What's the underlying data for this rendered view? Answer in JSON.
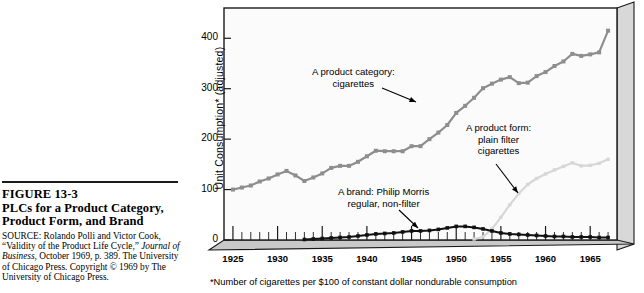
{
  "figure": {
    "number": "FIGURE 13-3",
    "title_line1": "PLCs for a Product Category,",
    "title_line2": "Product Form, and Brand",
    "source_prefix": "SOURCE: Rolando Polli and Victor Cook, “Validity of the Product Life Cycle,” ",
    "source_italic1": "Journal",
    "source_mid": " ",
    "source_italic2": "of Business",
    "source_suffix": ", October 1969, p. 389. The University of Chicago Press. Copyright © 1969 by The University of Chicago Press."
  },
  "chart_data": {
    "type": "line",
    "title": "PLCs for a Product Category, Product Form, and Brand",
    "xlabel": "",
    "ylabel": "Unit Consumption* (adjusted)",
    "footnote": "*Number of cigarettes per $100 of constant dollar nondurable consumption",
    "xlim": [
      1924,
      1968
    ],
    "ylim": [
      0,
      460
    ],
    "xticks": [
      1925,
      1930,
      1935,
      1940,
      1945,
      1950,
      1955,
      1960,
      1965
    ],
    "yticks": [
      0,
      100,
      200,
      300,
      400
    ],
    "grid": false,
    "legend_position": "annotations",
    "colors": {
      "category": "#8e8e8e",
      "form": "#d7d7d7",
      "brand": "#111111",
      "plot_background": "#fbfbfb",
      "floor": "#c9c9c9",
      "side_panel": "#d8d8d8",
      "frame": "#1a1a1a"
    },
    "series": [
      {
        "name": "A product category: cigarettes",
        "color": "#8e8e8e",
        "x": [
          1925,
          1926,
          1927,
          1928,
          1929,
          1930,
          1931,
          1932,
          1933,
          1934,
          1935,
          1936,
          1937,
          1938,
          1939,
          1940,
          1941,
          1942,
          1943,
          1944,
          1945,
          1946,
          1947,
          1948,
          1949,
          1950,
          1951,
          1952,
          1953,
          1954,
          1955,
          1956,
          1957,
          1958,
          1959,
          1960,
          1961,
          1962,
          1963,
          1964,
          1965,
          1966,
          1967
        ],
        "values": [
          100,
          104,
          108,
          116,
          122,
          130,
          137,
          128,
          117,
          124,
          132,
          143,
          147,
          147,
          155,
          166,
          177,
          176,
          176,
          176,
          186,
          186,
          200,
          213,
          228,
          252,
          266,
          282,
          301,
          310,
          318,
          323,
          311,
          312,
          325,
          333,
          345,
          354,
          369,
          365,
          368,
          372,
          415
        ]
      },
      {
        "name": "A product form: plain filter cigarettes",
        "color": "#d7d7d7",
        "x": [
          1952,
          1953,
          1954,
          1955,
          1956,
          1957,
          1958,
          1959,
          1960,
          1961,
          1962,
          1963,
          1964,
          1965,
          1966,
          1967
        ],
        "values": [
          2,
          6,
          22,
          45,
          70,
          92,
          110,
          122,
          131,
          139,
          146,
          153,
          147,
          148,
          152,
          160
        ]
      },
      {
        "name": "A brand: Philip Morris regular, non-filter",
        "color": "#111111",
        "x": [
          1933,
          1934,
          1935,
          1936,
          1937,
          1938,
          1939,
          1940,
          1941,
          1942,
          1943,
          1944,
          1945,
          1946,
          1947,
          1948,
          1949,
          1950,
          1951,
          1952,
          1953,
          1954,
          1955,
          1956,
          1957,
          1958,
          1959,
          1960,
          1961,
          1962,
          1963,
          1964,
          1965,
          1966,
          1967
        ],
        "values": [
          1,
          2,
          3,
          4,
          5,
          6,
          8,
          10,
          12,
          13,
          14,
          16,
          18,
          18,
          19,
          21,
          24,
          27,
          27,
          25,
          22,
          18,
          14,
          12,
          11,
          10,
          9,
          8,
          7,
          7,
          6,
          6,
          6,
          5,
          5
        ]
      }
    ],
    "annotations": [
      {
        "id": "category",
        "line1": "A product category:",
        "line2": "cigarettes",
        "label_x": 116,
        "label_y": 66,
        "arrow_from_x": 186,
        "arrow_from_y": 88,
        "arrow_to_x": 220,
        "arrow_to_y": 102
      },
      {
        "id": "form",
        "line1": "A product form:",
        "line2": "plain filter",
        "line3": "cigarettes",
        "label_x": 270,
        "label_y": 122,
        "arrow_from_x": 300,
        "arrow_from_y": 164,
        "arrow_to_x": 322,
        "arrow_to_y": 193
      },
      {
        "id": "brand",
        "line1": "A brand: Philip Morris",
        "line2": "regular, non-filter",
        "label_x": 142,
        "label_y": 186,
        "arrow_from_x": 203,
        "arrow_from_y": 210,
        "arrow_to_x": 222,
        "arrow_to_y": 228
      }
    ]
  }
}
